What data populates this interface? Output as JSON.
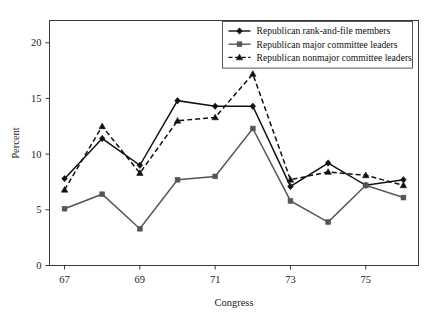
{
  "chart_data": {
    "type": "line",
    "title": "",
    "xlabel": "Congress",
    "ylabel": "Percent",
    "x": [
      67,
      68,
      69,
      70,
      71,
      72,
      73,
      74,
      75,
      76
    ],
    "categories": [
      "67",
      "68",
      "69",
      "70",
      "71",
      "72",
      "73",
      "74",
      "75",
      "76"
    ],
    "xtick_labels": [
      "67",
      "69",
      "71",
      "73",
      "75"
    ],
    "xtick_values": [
      67,
      69,
      71,
      73,
      75
    ],
    "ytick_labels": [
      "0",
      "5",
      "10",
      "15",
      "20"
    ],
    "ytick_values": [
      0,
      5,
      10,
      15,
      20
    ],
    "xlim": [
      66.6,
      76.4
    ],
    "ylim": [
      0,
      22
    ],
    "grid": false,
    "legend_position": "top-right",
    "series": [
      {
        "name": "Republican rank-and-file members",
        "values": [
          7.8,
          11.4,
          9.0,
          14.8,
          14.3,
          14.3,
          7.1,
          9.2,
          7.2,
          7.7
        ],
        "color": "#111111",
        "style": "solid",
        "marker": "diamond"
      },
      {
        "name": "Republican major committee leaders",
        "values": [
          5.1,
          6.4,
          3.3,
          7.7,
          8.0,
          12.3,
          5.8,
          3.9,
          7.2,
          6.1
        ],
        "color": "#555555",
        "style": "solid",
        "marker": "square"
      },
      {
        "name": "Republican nonmajor committee leaders",
        "values": [
          6.8,
          12.5,
          8.3,
          13.0,
          13.3,
          17.2,
          7.7,
          8.4,
          8.1,
          7.2
        ],
        "color": "#111111",
        "style": "dashed",
        "marker": "triangle"
      }
    ]
  },
  "legend": {
    "items": [
      "Republican rank-and-file members",
      "Republican major committee leaders",
      "Republican nonmajor committee leaders"
    ]
  }
}
